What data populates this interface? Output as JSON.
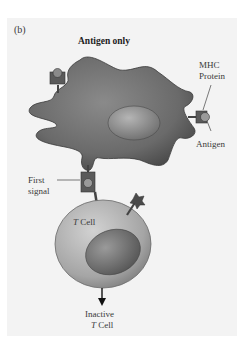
{
  "figure": {
    "panel_label": "(b)",
    "title": "Antigen only"
  },
  "labels": {
    "mhc_protein_line1": "MHC",
    "mhc_protein_line2": "Protein",
    "antigen": "Antigen",
    "first_signal_line1": "First",
    "first_signal_line2": "signal",
    "t_cell_italic": "T",
    "t_cell_rest": " Cell",
    "inactive_line1": "Inactive",
    "inactive_line2_italic": "T",
    "inactive_line2_rest": " Cell"
  },
  "colors": {
    "apc_fill": "#6e6e6e",
    "apc_nucleus": "#8f8f8f",
    "t_cell_fill": "#a9a9a9",
    "t_cell_nucleus": "#7b7b7b",
    "receptor": "#555555",
    "background": "#f3f3f3"
  }
}
